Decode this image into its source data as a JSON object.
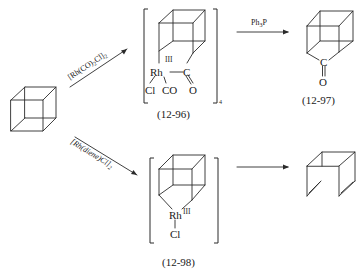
{
  "scheme": {
    "type": "reaction-scheme",
    "starting_material": {
      "name": "cubane"
    },
    "reagents": {
      "top": {
        "text": "[Rh(CO)",
        "sub1": "2",
        "text2": "Cl]",
        "sub2": "2"
      },
      "bottom": {
        "text": "[Rh(diene)Cl]",
        "sub": "2"
      },
      "top_right": {
        "text": "Ph",
        "sub": "3",
        "text2": "P"
      },
      "bottom_right": {
        "text": ""
      }
    },
    "compounds": {
      "c96": {
        "label": "(12-96)",
        "atoms": {
          "rh": "Rh",
          "c": "C",
          "o": "O",
          "cl": "Cl",
          "co": "CO"
        },
        "oxidation_state": "III",
        "bracket_subscript": "4"
      },
      "c97": {
        "label": "(12-97)",
        "atoms": {
          "c": "C",
          "o": "O"
        }
      },
      "c98": {
        "label": "(12-98)",
        "atoms": {
          "rh": "Rh",
          "cl": "Cl"
        },
        "oxidation_state": "III"
      },
      "product_bottom": {
        "name": "syn-tricyclooctadiene"
      }
    }
  }
}
